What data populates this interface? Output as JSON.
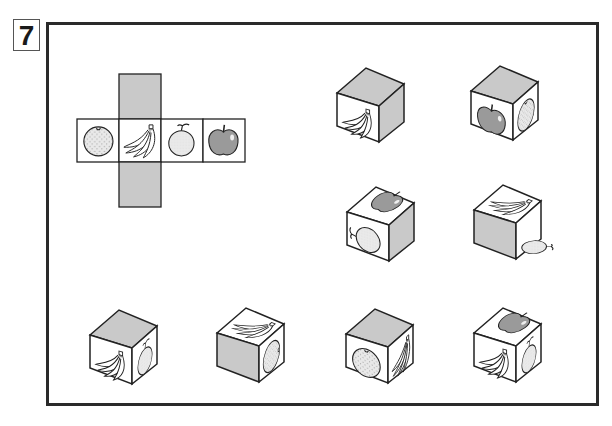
{
  "question": {
    "number": "7"
  },
  "colors": {
    "gray_face": "#c9c9c9",
    "apple_fill": "#9a9a9a",
    "orange_fill": "#e6e6e6",
    "pear_fill": "#e8e8e8",
    "line": "#222222",
    "frame": "#2a2a2a"
  },
  "net": {
    "faces": [
      {
        "position": "top",
        "content": "gray"
      },
      {
        "position": "left",
        "content": "orange"
      },
      {
        "position": "center",
        "content": "banana"
      },
      {
        "position": "right",
        "content": "pear"
      },
      {
        "position": "far-right",
        "content": "apple"
      },
      {
        "position": "bottom",
        "content": "gray"
      }
    ]
  },
  "cubes": [
    {
      "id": "A",
      "top": "gray",
      "front": "banana",
      "right": "gray"
    },
    {
      "id": "B",
      "top": "gray",
      "front": "apple",
      "right": "orange"
    },
    {
      "id": "C",
      "top": "apple",
      "front": "pear-rotated",
      "right": "gray"
    },
    {
      "id": "D",
      "top": "banana",
      "front": "gray",
      "right": "pear-rotated"
    },
    {
      "id": "E",
      "top": "gray",
      "front": "banana",
      "right": "pear"
    },
    {
      "id": "F",
      "top": "banana",
      "front": "gray",
      "right": "orange"
    },
    {
      "id": "G",
      "top": "gray",
      "front": "orange",
      "right": "banana"
    },
    {
      "id": "H",
      "top": "apple",
      "front": "banana",
      "right": "pear"
    }
  ]
}
